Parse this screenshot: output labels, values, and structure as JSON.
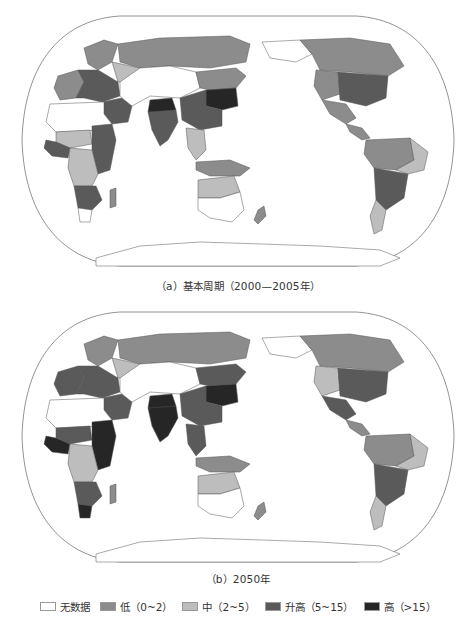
{
  "figure": {
    "panels": [
      {
        "id": "a",
        "caption": "（a）基本周期（2000—2005年）",
        "regions": {
          "europe_central": "inc",
          "europe_west": "low",
          "scandinavia": "low",
          "russia_north": "low",
          "russia_west": "mid",
          "central_asia": "nodata",
          "middle_east_turkey": "inc",
          "north_africa": "nodata",
          "west_africa_sahel": "mid",
          "west_africa_coast": "inc",
          "east_africa_nile": "inc",
          "central_africa": "mid",
          "southern_africa": "inc",
          "south_africa_cape": "nodata",
          "madagascar": "low",
          "india": "inc",
          "india_north": "high",
          "china_north": "high",
          "china_south": "inc",
          "mongolia_siberia_south": "low",
          "southeast_asia": "mid",
          "indonesia": "low",
          "australia_north": "mid",
          "australia_south": "nodata",
          "new_zealand": "low",
          "canada": "low",
          "alaska": "nodata",
          "usa_east": "inc",
          "usa_west": "low",
          "mexico": "low",
          "central_america": "low",
          "amazon": "low",
          "brazil_east": "mid",
          "south_america_south": "inc",
          "patagonia": "mid",
          "antarctica": "nodata"
        }
      },
      {
        "id": "b",
        "caption": "（b）2050年",
        "regions": {
          "europe_central": "inc",
          "europe_west": "inc",
          "scandinavia": "low",
          "russia_north": "low",
          "russia_west": "mid",
          "central_asia": "nodata",
          "middle_east_turkey": "inc",
          "north_africa": "nodata",
          "west_africa_sahel": "inc",
          "west_africa_coast": "high",
          "east_africa_nile": "high",
          "central_africa": "mid",
          "southern_africa": "inc",
          "south_africa_cape": "high",
          "madagascar": "low",
          "india": "high",
          "india_north": "high",
          "china_north": "high",
          "china_south": "inc",
          "mongolia_siberia_south": "inc",
          "southeast_asia": "inc",
          "indonesia": "low",
          "australia_north": "mid",
          "australia_south": "nodata",
          "new_zealand": "low",
          "canada": "low",
          "alaska": "nodata",
          "usa_east": "inc",
          "usa_west": "mid",
          "mexico": "inc",
          "central_america": "low",
          "amazon": "low",
          "brazil_east": "mid",
          "south_america_south": "inc",
          "patagonia": "mid",
          "antarctica": "nodata"
        }
      }
    ]
  },
  "legend": {
    "items": [
      {
        "key": "nodata",
        "label": "无数据",
        "color": "#ffffff"
      },
      {
        "key": "low",
        "label": "低（0~2）",
        "color": "#8c8c8c"
      },
      {
        "key": "mid",
        "label": "中（2~5）",
        "color": "#bdbdbd"
      },
      {
        "key": "inc",
        "label": "升高（5~15）",
        "color": "#5a5a5a"
      },
      {
        "key": "high",
        "label": "高（>15）",
        "color": "#262626"
      }
    ]
  }
}
